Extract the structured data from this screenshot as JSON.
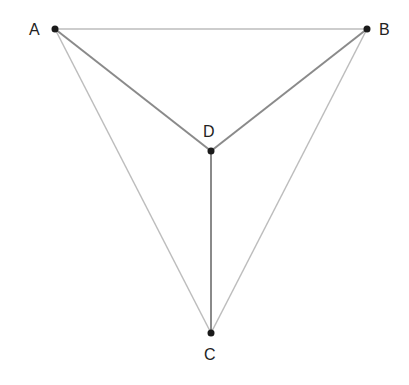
{
  "diagram": {
    "points": [
      {
        "id": "A",
        "label": "A",
        "x": 55,
        "y": 29,
        "lx": 29,
        "ly": 35
      },
      {
        "id": "B",
        "label": "B",
        "x": 367,
        "y": 29,
        "lx": 379,
        "ly": 35
      },
      {
        "id": "C",
        "label": "C",
        "x": 211,
        "y": 333,
        "lx": 204,
        "ly": 360
      },
      {
        "id": "D",
        "label": "D",
        "x": 211,
        "y": 151,
        "lx": 203,
        "ly": 137
      }
    ],
    "edges": [
      {
        "from": "A",
        "to": "B",
        "style": "light"
      },
      {
        "from": "A",
        "to": "C",
        "style": "light"
      },
      {
        "from": "B",
        "to": "C",
        "style": "light"
      },
      {
        "from": "A",
        "to": "D",
        "style": "dark"
      },
      {
        "from": "B",
        "to": "D",
        "style": "dark"
      },
      {
        "from": "D",
        "to": "C",
        "style": "dark"
      }
    ],
    "colors": {
      "light": "#bdbdbd",
      "dark": "#8a8a8a",
      "point": "#1a1a1a"
    }
  }
}
